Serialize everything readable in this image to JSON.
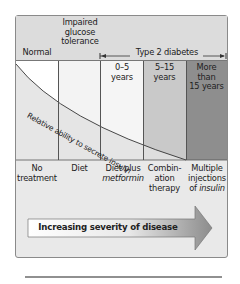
{
  "header": {
    "normal": "Normal",
    "igt_line1": "Impaired",
    "igt_line2": "glucose",
    "igt_line3": "tolerance",
    "t2d_label": "Type 2 diabetes"
  },
  "stages": [
    {
      "label": "",
      "fill": "#ffffff"
    },
    {
      "label": "",
      "fill": "#f1f1f1"
    },
    {
      "label_l1": "0–5",
      "label_l2": "years",
      "fill": "#f4f4f4"
    },
    {
      "label_l1": "5–15",
      "label_l2": "years",
      "fill": "#c9c9c9"
    },
    {
      "label_l1": "More",
      "label_l2": "than",
      "label_l3": "15 years",
      "fill": "#8e8e8e"
    }
  ],
  "curve_label": "Relative ability to secrete insulin",
  "treatments": [
    {
      "l1": "No",
      "l2": "treatment"
    },
    {
      "l1": "Diet"
    },
    {
      "l1": "Diet plus",
      "l2_italic": "metformin"
    },
    {
      "l1": "Combin-",
      "l2": "ation",
      "l3": "therapy"
    },
    {
      "l1": "Multiple",
      "l2": "injections",
      "l3_prefix": "of ",
      "l3_italic": "insulin"
    }
  ],
  "arrow_label": "Increasing severity of disease",
  "colors": {
    "header_bg": "#dcdcdc",
    "box_bg": "#e9e9e9",
    "border": "#8a8a8a",
    "arrow_start": "#ffffff",
    "arrow_end": "#8c8c8c"
  }
}
